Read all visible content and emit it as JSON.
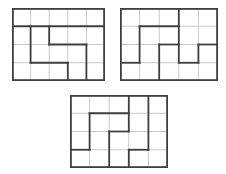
{
  "figure": {
    "background_color": "#ffffff",
    "grid_line_color": "#c9c9c9",
    "piece_line_color": "#3f3f3f",
    "grid_line_width": 1,
    "piece_line_width": 1.8,
    "puzzles": [
      {
        "id": "top-left-grid",
        "cols": 5,
        "rows": 4,
        "x": 12,
        "y": 8,
        "width": 93,
        "height": 73,
        "segments": [
          {
            "o": "h",
            "row": 1,
            "from": 0,
            "to": 5
          },
          {
            "o": "v",
            "col": 1,
            "from": 1,
            "to": 3
          },
          {
            "o": "v",
            "col": 2,
            "from": 1,
            "to": 2
          },
          {
            "o": "h",
            "row": 2,
            "from": 2,
            "to": 4
          },
          {
            "o": "v",
            "col": 4,
            "from": 2,
            "to": 4
          },
          {
            "o": "h",
            "row": 3,
            "from": 1,
            "to": 3
          },
          {
            "o": "v",
            "col": 3,
            "from": 3,
            "to": 4
          }
        ]
      },
      {
        "id": "top-right-grid",
        "cols": 5,
        "rows": 4,
        "x": 120,
        "y": 8,
        "width": 98,
        "height": 73,
        "segments": [
          {
            "o": "h",
            "row": 1,
            "from": 1,
            "to": 3
          },
          {
            "o": "v",
            "col": 1,
            "from": 1,
            "to": 3
          },
          {
            "o": "h",
            "row": 3,
            "from": 0,
            "to": 1
          },
          {
            "o": "v",
            "col": 3,
            "from": 0,
            "to": 3
          },
          {
            "o": "h",
            "row": 2,
            "from": 2,
            "to": 3
          },
          {
            "o": "v",
            "col": 2,
            "from": 2,
            "to": 4
          },
          {
            "o": "h",
            "row": 3,
            "from": 3,
            "to": 4
          },
          {
            "o": "v",
            "col": 4,
            "from": 2,
            "to": 3
          },
          {
            "o": "h",
            "row": 2,
            "from": 4,
            "to": 5
          }
        ]
      },
      {
        "id": "bottom-center-grid",
        "cols": 5,
        "rows": 4,
        "x": 70,
        "y": 95,
        "width": 98,
        "height": 73,
        "segments": [
          {
            "o": "h",
            "row": 1,
            "from": 1,
            "to": 3
          },
          {
            "o": "v",
            "col": 1,
            "from": 1,
            "to": 3
          },
          {
            "o": "h",
            "row": 3,
            "from": 0,
            "to": 1
          },
          {
            "o": "v",
            "col": 2,
            "from": 2,
            "to": 4
          },
          {
            "o": "h",
            "row": 2,
            "from": 2,
            "to": 3
          },
          {
            "o": "v",
            "col": 3,
            "from": 0,
            "to": 2
          },
          {
            "o": "v",
            "col": 3,
            "from": 3,
            "to": 4
          },
          {
            "o": "h",
            "row": 3,
            "from": 3,
            "to": 4
          },
          {
            "o": "v",
            "col": 4,
            "from": 0,
            "to": 3
          }
        ]
      }
    ]
  }
}
